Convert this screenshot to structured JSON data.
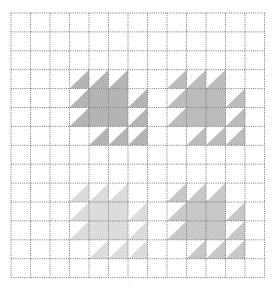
{
  "diagram": {
    "grid": {
      "x0": 11,
      "y0": 13,
      "cols": 13,
      "rows": 14,
      "cell_w": 19.5,
      "cell_h": 18.9,
      "line_color": "#555555",
      "line_style": "dotted"
    },
    "block_pattern": {
      "size": 4,
      "cells": [
        {
          "r": 0,
          "c": 0,
          "t": "tri"
        },
        {
          "r": 0,
          "c": 1,
          "t": "tri"
        },
        {
          "r": 0,
          "c": 2,
          "t": "tri"
        },
        {
          "r": 1,
          "c": 0,
          "t": "tri"
        },
        {
          "r": 1,
          "c": 1,
          "t": "full"
        },
        {
          "r": 1,
          "c": 2,
          "t": "full"
        },
        {
          "r": 1,
          "c": 3,
          "t": "tri"
        },
        {
          "r": 2,
          "c": 0,
          "t": "tri"
        },
        {
          "r": 2,
          "c": 1,
          "t": "full"
        },
        {
          "r": 2,
          "c": 2,
          "t": "full"
        },
        {
          "r": 2,
          "c": 3,
          "t": "tri"
        },
        {
          "r": 3,
          "c": 1,
          "t": "tri"
        },
        {
          "r": 3,
          "c": 2,
          "t": "tri"
        },
        {
          "r": 3,
          "c": 3,
          "t": "tri"
        }
      ]
    },
    "blocks": [
      {
        "name": "top-left",
        "col": 3,
        "row": 3,
        "color": "#b4b4b4"
      },
      {
        "name": "top-right",
        "col": 8,
        "row": 3,
        "color": "#bcbcbc"
      },
      {
        "name": "bottom-left",
        "col": 3,
        "row": 9,
        "color": "#dcdcdc"
      },
      {
        "name": "bottom-right",
        "col": 8,
        "row": 9,
        "color": "#c8c8c8"
      }
    ],
    "footer_mark": "··"
  }
}
